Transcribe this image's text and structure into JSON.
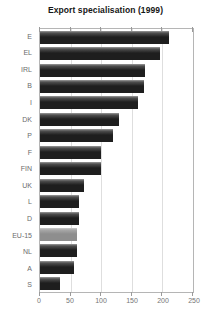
{
  "chart_data": {
    "type": "bar",
    "orientation": "horizontal",
    "title": "Export specialisation (1999)",
    "categories": [
      "E",
      "EL",
      "IRL",
      "B",
      "I",
      "DK",
      "P",
      "F",
      "FIN",
      "UK",
      "L",
      "D",
      "EU-15",
      "NL",
      "A",
      "S"
    ],
    "values": [
      210,
      196,
      171,
      170,
      160,
      129,
      120,
      99,
      100,
      72,
      63,
      63,
      60,
      61,
      56,
      32
    ],
    "xlabel": "",
    "ylabel": "",
    "xlim": [
      0,
      250
    ],
    "xticks": [
      0,
      50,
      100,
      150,
      200,
      250
    ],
    "grid": "vertical gridlines every 50",
    "legend": "none",
    "highlight_category": "EU-15"
  },
  "colors": {
    "bar_top_edge": "#9b9b9b",
    "bar_upper_shade": "#4f4f4f",
    "bar_body": "#1e1e1e",
    "highlight_top_edge": "#cccccc",
    "highlight_upper_shade": "#a8a8a8",
    "highlight_body": "#8e8e8e",
    "plot_border": "#b5b5b5",
    "gridline": "#dedede",
    "tick": "#9a9a9a",
    "category_label_text": "#6b6b6b",
    "axis_label_text": "#757575",
    "title_text": "#161616",
    "background": "#ffffff"
  }
}
